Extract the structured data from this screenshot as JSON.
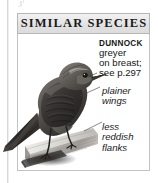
{
  "panel": {
    "title": "SIMILAR SPECIES",
    "species_name": "DUNNOCK",
    "description_lines": [
      "greyer",
      "on breast;",
      "see p.297"
    ],
    "callouts": [
      {
        "id": "wings",
        "lines": [
          "plainer",
          "wings"
        ]
      },
      {
        "id": "flanks",
        "lines": [
          "less",
          "reddish",
          "flanks"
        ]
      }
    ]
  },
  "illustration": {
    "subject": "dunnock-bird-perched",
    "description": "grayscale photograph of a dunnock perched on a wooden rail"
  },
  "colors": {
    "header_background": "#e3e3e3",
    "header_border": "#b6b6b6",
    "body_border": "#c2c2c2",
    "text": "#171717",
    "page_rule": "#d8d8d8"
  }
}
